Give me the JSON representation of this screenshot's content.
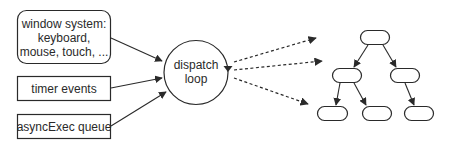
{
  "diagram": {
    "sources": [
      {
        "id": "window-system",
        "lines": [
          "window system:",
          "keyboard,",
          "mouse, touch, ..."
        ],
        "shape": "rounded-rect"
      },
      {
        "id": "timer-events",
        "lines": [
          "timer events"
        ],
        "shape": "rect"
      },
      {
        "id": "async-exec-queue",
        "lines": [
          "asyncExec queue"
        ],
        "shape": "rect"
      }
    ],
    "center": {
      "id": "dispatch-loop",
      "lines": [
        "dispatch",
        "loop"
      ],
      "shape": "circle-with-loop-arrow"
    },
    "tree": {
      "description": "widget tree (unlabeled nodes)",
      "nodes": [
        "root",
        "left-child",
        "right-child",
        "left-left-leaf",
        "left-right-leaf",
        "right-leaf"
      ],
      "edges": [
        [
          "root",
          "left-child"
        ],
        [
          "root",
          "right-child"
        ],
        [
          "left-child",
          "left-left-leaf"
        ],
        [
          "left-child",
          "left-right-leaf"
        ],
        [
          "right-child",
          "right-leaf"
        ]
      ]
    },
    "connections": {
      "sources_to_center": "solid arrows",
      "center_to_tree": "3 dashed arrows"
    },
    "colors": {
      "stroke": "#2a2a2a",
      "background": "#ffffff"
    }
  }
}
